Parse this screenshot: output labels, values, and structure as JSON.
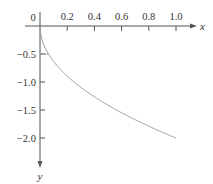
{
  "chart_data": {
    "type": "line",
    "title": "",
    "xlabel": "x",
    "ylabel": "y",
    "xlim": [
      0,
      1.1
    ],
    "ylim": [
      -2.4,
      0
    ],
    "x_ticks": [
      0.2,
      0.4,
      0.6,
      0.8,
      1.0
    ],
    "x_tick_labels": [
      "0.2",
      "0.4",
      "0.6",
      "0.8",
      "1.0"
    ],
    "y_ticks": [
      -0.5,
      -1.0,
      -1.5,
      -2.0
    ],
    "y_tick_labels": [
      "−0.5",
      "−1.0",
      "−1.5",
      "−2.0"
    ],
    "origin_label": "0",
    "grid": false,
    "legend": null,
    "series": [
      {
        "name": "y = -2√x",
        "x": [
          0,
          0.0625,
          0.1,
          0.2,
          0.3,
          0.4,
          0.5,
          0.6,
          0.7,
          0.8,
          0.9,
          1.0
        ],
        "y": [
          0,
          -0.5,
          -0.63,
          -0.89,
          -1.1,
          -1.26,
          -1.41,
          -1.55,
          -1.67,
          -1.79,
          -1.9,
          -2.0
        ]
      }
    ]
  },
  "colors": {
    "axis": "#555555",
    "curve": "#999999",
    "text": "#333333"
  }
}
